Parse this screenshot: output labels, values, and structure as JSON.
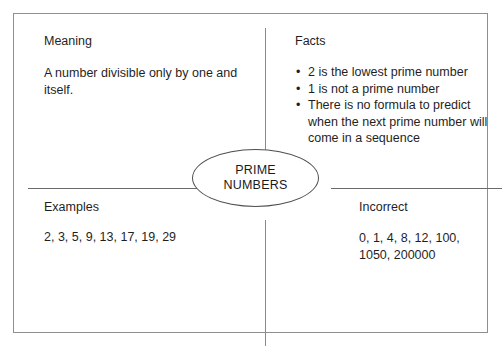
{
  "diagram": {
    "type": "frayer-model",
    "center": {
      "label_lines": [
        "PRIME",
        "NUMBERS"
      ],
      "shape": "ellipse"
    },
    "quadrants": {
      "meaning": {
        "heading": "Meaning",
        "body": "A number divisible only by one and itself."
      },
      "facts": {
        "heading": "Facts",
        "items": [
          "2 is the lowest prime number",
          "1 is not a prime number",
          "There is no formula to predict when the next prime number will come in a sequence"
        ],
        "bullet_glyph": "•"
      },
      "examples": {
        "heading": "Examples",
        "body": "2, 3, 5, 9, 13, 17, 19, 29"
      },
      "incorrect": {
        "heading": "Incorrect",
        "body": "0, 1, 4, 8, 12, 100, 1050, 200000"
      }
    },
    "colors": {
      "frame": "#8f8f8f",
      "divider": "#8a8a8a",
      "ellipse": "#4f4f4f",
      "text": "#1f1f1f",
      "background": "#ffffff"
    }
  }
}
